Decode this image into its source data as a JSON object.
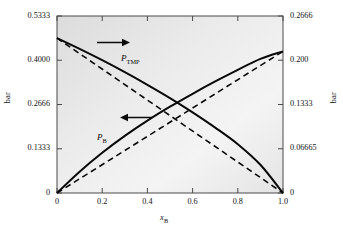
{
  "figure": {
    "kind": "vapor-pressure-diagram",
    "background": "#ffffff",
    "plot_fill_light": "#f2f2f2",
    "plot_fill_dark": "#d8d8d8",
    "frame_color": "#555555",
    "curve_color": "#0a0a0a"
  },
  "axes": {
    "left_title": "bar",
    "right_title": "bar",
    "x_title_main": "x",
    "x_title_sub": "B"
  },
  "labels": {
    "p_tmp_main": "P",
    "p_tmp_sub": "TMP",
    "p_b_main": "P",
    "p_b_sub": "B",
    "arrow_right": "→",
    "arrow_left": "←"
  },
  "chart_data": {
    "type": "line",
    "title": "",
    "xlabel": "x_B",
    "ylabel": "bar",
    "ylabel_right": "bar",
    "xlim": [
      0,
      1.0
    ],
    "ylim_left": [
      0,
      0.5333
    ],
    "ylim_right": [
      0,
      0.2666
    ],
    "grid": false,
    "legend": "inline-labels",
    "x_ticks": [
      "0",
      "0.2",
      "0.4",
      "0.6",
      "0.8",
      "1.0"
    ],
    "x_tick_values": [
      0,
      0.2,
      0.4,
      0.6,
      0.8,
      1.0
    ],
    "y_ticks_left": [
      "0",
      "0.1333",
      "0.2666",
      "0.4000",
      "0.5333"
    ],
    "y_tick_values_left": [
      0,
      0.1333,
      0.2666,
      0.4,
      0.5333
    ],
    "y_ticks_right": [
      "0",
      "0.06665",
      "0.1333",
      "0.200",
      "0.2666"
    ],
    "y_tick_values_right": [
      0,
      0.06665,
      0.1333,
      0.2,
      0.2666
    ],
    "annotations": [
      {
        "text": "P_TMP",
        "note": "solid decreasing curve, read on right axis"
      },
      {
        "text": "P_B",
        "note": "solid increasing curve, read on left axis"
      },
      {
        "text": "arrow right",
        "note": "P_TMP uses right-hand bar axis"
      },
      {
        "text": "arrow left",
        "note": "P_B uses left-hand bar axis"
      }
    ],
    "series": [
      {
        "name": "P_B (actual)",
        "style": "solid",
        "axis": "left",
        "x": [
          0,
          0.1,
          0.2,
          0.3,
          0.4,
          0.5,
          0.6,
          0.7,
          0.8,
          0.9,
          1.0
        ],
        "values": [
          0,
          0.064,
          0.121,
          0.172,
          0.218,
          0.26,
          0.299,
          0.336,
          0.371,
          0.404,
          0.4267
        ]
      },
      {
        "name": "P_B (Raoult ideal)",
        "style": "dashed",
        "axis": "left",
        "x": [
          0,
          1.0
        ],
        "values": [
          0,
          0.4267
        ]
      },
      {
        "name": "P_TMP (actual)",
        "style": "solid",
        "axis": "right",
        "x": [
          0,
          0.1,
          0.2,
          0.3,
          0.4,
          0.5,
          0.6,
          0.7,
          0.8,
          0.9,
          1.0
        ],
        "values": [
          0.2333,
          0.217,
          0.2,
          0.182,
          0.163,
          0.143,
          0.1215,
          0.0985,
          0.0735,
          0.0425,
          0
        ]
      },
      {
        "name": "P_TMP (Raoult ideal)",
        "style": "dashed",
        "axis": "right",
        "x": [
          0,
          1.0
        ],
        "values": [
          0.2333,
          0
        ]
      }
    ]
  }
}
